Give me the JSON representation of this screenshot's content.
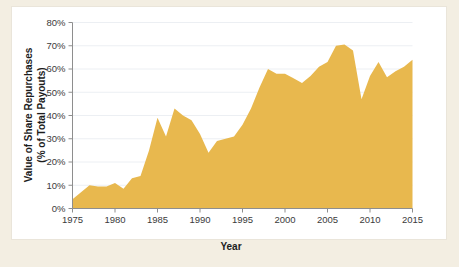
{
  "figure": {
    "background_color": "#f3eee2",
    "panel_color": "#ffffff"
  },
  "chart_data": {
    "type": "area",
    "title": "",
    "xlabel": "Year",
    "ylabel": "Value of Share Repurchases\n(% of Total Payouts)",
    "ylabel_line1": "Value of Share Repurchases",
    "ylabel_line2": "(% of Total Payouts)",
    "series_name": "Value of Share Repurchases",
    "fill_color": "#e8b84e",
    "xlim": [
      1975,
      2015
    ],
    "ylim": [
      0,
      80
    ],
    "grid": true,
    "legend": "none",
    "xticks": [
      1975,
      1980,
      1985,
      1990,
      1995,
      2000,
      2005,
      2010,
      2015
    ],
    "xtick_labels": [
      "1975",
      "1980",
      "1985",
      "1990",
      "1995",
      "2000",
      "2005",
      "2010",
      "2015"
    ],
    "yticks": [
      0,
      10,
      20,
      30,
      40,
      50,
      60,
      70,
      80
    ],
    "ytick_labels": [
      "0%",
      "10%",
      "20%",
      "30%",
      "40%",
      "50%",
      "60%",
      "70%",
      "80%"
    ],
    "x": [
      1975,
      1976,
      1977,
      1978,
      1979,
      1980,
      1981,
      1982,
      1983,
      1984,
      1985,
      1986,
      1987,
      1988,
      1989,
      1990,
      1991,
      1992,
      1993,
      1994,
      1995,
      1996,
      1997,
      1998,
      1999,
      2000,
      2001,
      2002,
      2003,
      2004,
      2005,
      2006,
      2007,
      2008,
      2009,
      2010,
      2011,
      2012,
      2013,
      2014,
      2015
    ],
    "values": [
      4,
      7,
      10,
      9.5,
      9.5,
      11,
      8.5,
      13,
      14,
      25,
      39,
      31,
      43,
      40,
      38,
      32,
      24,
      29,
      30,
      31,
      36,
      43,
      52,
      60,
      58,
      58,
      56,
      54,
      57,
      61,
      63,
      70,
      70.5,
      68,
      47,
      57,
      63,
      56.5,
      59,
      61,
      64
    ]
  }
}
